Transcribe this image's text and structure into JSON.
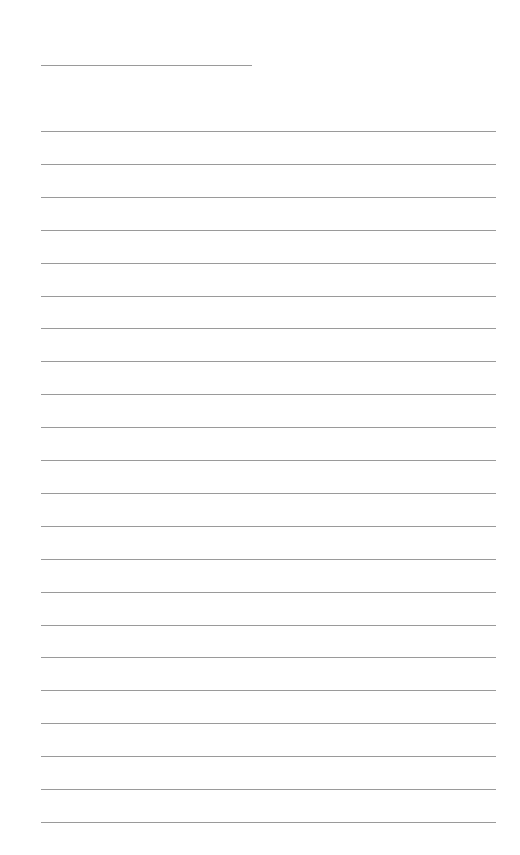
{
  "page": {
    "type": "blank lined sheet",
    "background_color": "#ffffff",
    "line_color": "#9a9a9a"
  },
  "title_line": {
    "text": ""
  },
  "lines": [
    {
      "y": 131,
      "text": ""
    },
    {
      "y": 164,
      "text": ""
    },
    {
      "y": 197,
      "text": ""
    },
    {
      "y": 230,
      "text": ""
    },
    {
      "y": 263,
      "text": ""
    },
    {
      "y": 296,
      "text": ""
    },
    {
      "y": 328,
      "text": ""
    },
    {
      "y": 361,
      "text": ""
    },
    {
      "y": 394,
      "text": ""
    },
    {
      "y": 427,
      "text": ""
    },
    {
      "y": 460,
      "text": ""
    },
    {
      "y": 493,
      "text": ""
    },
    {
      "y": 526,
      "text": ""
    },
    {
      "y": 559,
      "text": ""
    },
    {
      "y": 592,
      "text": ""
    },
    {
      "y": 625,
      "text": ""
    },
    {
      "y": 657,
      "text": ""
    },
    {
      "y": 690,
      "text": ""
    },
    {
      "y": 723,
      "text": ""
    },
    {
      "y": 756,
      "text": ""
    },
    {
      "y": 789,
      "text": ""
    },
    {
      "y": 822,
      "text": ""
    }
  ]
}
